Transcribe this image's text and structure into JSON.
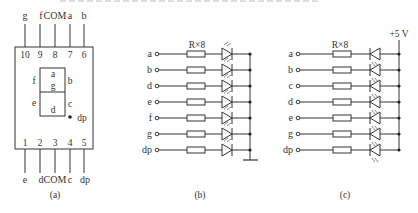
{
  "figure": {
    "panels": {
      "a": {
        "caption": "(a)",
        "top_pins": [
          {
            "label": "g",
            "number": "10"
          },
          {
            "label": "f",
            "number": "9"
          },
          {
            "label": "COM",
            "number": "8"
          },
          {
            "label": "a",
            "number": "7"
          },
          {
            "label": "b",
            "number": "6"
          }
        ],
        "bottom_pins": [
          {
            "label": "e",
            "number": "1"
          },
          {
            "label": "d",
            "number": "2"
          },
          {
            "label": "COM",
            "number": "3"
          },
          {
            "label": "c",
            "number": "4"
          },
          {
            "label": "dp",
            "number": "5"
          }
        ],
        "segments": {
          "a": "a",
          "b": "b",
          "c": "c",
          "d": "d",
          "e": "e",
          "f": "f",
          "g": "g",
          "dp": "dp"
        }
      },
      "b": {
        "caption": "(b)",
        "resistor_label": "R×8",
        "inputs": [
          "a",
          "b",
          "d",
          "e",
          "f",
          "g",
          "dp"
        ],
        "common": "ground"
      },
      "c": {
        "caption": "(c)",
        "resistor_label": "R×8",
        "supply_label": "+5 V",
        "inputs": [
          "a",
          "b",
          "c",
          "d",
          "e",
          "g",
          "dp"
        ]
      }
    }
  }
}
